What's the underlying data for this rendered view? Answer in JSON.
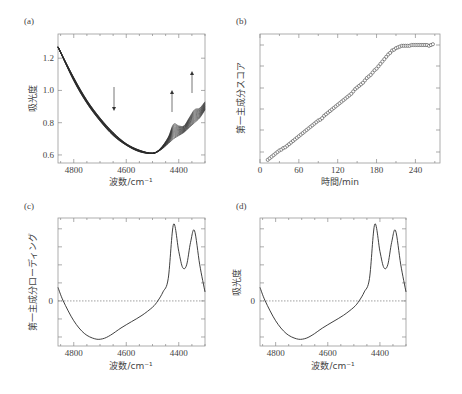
{
  "chart_data": [
    {
      "panel": "(a)",
      "type": "line",
      "title": "",
      "xlabel": "波数/cm⁻¹",
      "ylabel": "吸光度",
      "xlim": [
        4860,
        4300
      ],
      "ylim": [
        0.55,
        1.35
      ],
      "x_reversed": true,
      "xticks": [
        4800,
        4600,
        4400
      ],
      "yticks": [
        0.6,
        0.8,
        1.0,
        1.2
      ],
      "ytick_labels": [
        "0.6",
        "0.8",
        "1.0",
        "1.2"
      ],
      "grid": false,
      "series_description": "family of overlaid NIR spectra; minimum ~0.61 near 4500 cm⁻¹; bands near 4420 and 4340 cm⁻¹ grow with time",
      "series": [
        {
          "name": "first spectrum",
          "x": [
            4860,
            4800,
            4750,
            4700,
            4650,
            4600,
            4550,
            4500,
            4470,
            4440,
            4420,
            4400,
            4380,
            4360,
            4340,
            4320,
            4300
          ],
          "values": [
            1.27,
            1.08,
            0.94,
            0.83,
            0.74,
            0.67,
            0.63,
            0.61,
            0.63,
            0.67,
            0.7,
            0.72,
            0.74,
            0.77,
            0.8,
            0.83,
            0.88
          ]
        },
        {
          "name": "last spectrum",
          "x": [
            4860,
            4800,
            4750,
            4700,
            4650,
            4600,
            4550,
            4500,
            4470,
            4440,
            4420,
            4400,
            4380,
            4360,
            4340,
            4320,
            4300
          ],
          "values": [
            1.27,
            1.06,
            0.92,
            0.81,
            0.72,
            0.66,
            0.62,
            0.61,
            0.64,
            0.71,
            0.79,
            0.78,
            0.78,
            0.83,
            0.88,
            0.89,
            0.93
          ]
        }
      ],
      "annotations": [
        {
          "type": "arrow-down",
          "x": 4650,
          "y_from": 1.0,
          "y_to": 0.87
        },
        {
          "type": "arrow-up",
          "x": 4420,
          "y_from": 0.86,
          "y_to": 0.99
        },
        {
          "type": "arrow-up",
          "x": 4340,
          "y_from": 0.98,
          "y_to": 1.11
        }
      ]
    },
    {
      "panel": "(b)",
      "type": "scatter",
      "title": "",
      "xlabel": "時間/min",
      "ylabel": "第一主成分スコア",
      "xlim": [
        0,
        278
      ],
      "xticks": [
        0,
        60,
        120,
        180,
        240
      ],
      "yticks_unlabeled": 6,
      "grid": false,
      "marker": "open-circle",
      "x": [
        12,
        15,
        18,
        21,
        24,
        27,
        30,
        33,
        36,
        39,
        42,
        45,
        48,
        51,
        54,
        57,
        60,
        63,
        66,
        69,
        72,
        75,
        78,
        81,
        84,
        87,
        90,
        93,
        96,
        99,
        102,
        105,
        108,
        111,
        114,
        117,
        120,
        123,
        126,
        129,
        132,
        135,
        138,
        141,
        144,
        147,
        150,
        153,
        156,
        159,
        162,
        165,
        168,
        171,
        174,
        177,
        180,
        183,
        186,
        189,
        192,
        195,
        198,
        201,
        204,
        207,
        210,
        213,
        216,
        219,
        222,
        225,
        228,
        231,
        234,
        237,
        240,
        243,
        246,
        249,
        252,
        255,
        258,
        261,
        264,
        267
      ],
      "values": [
        0.02,
        0.03,
        0.04,
        0.05,
        0.06,
        0.07,
        0.08,
        0.085,
        0.095,
        0.1,
        0.11,
        0.12,
        0.13,
        0.14,
        0.15,
        0.16,
        0.17,
        0.18,
        0.19,
        0.2,
        0.21,
        0.22,
        0.23,
        0.24,
        0.25,
        0.26,
        0.27,
        0.275,
        0.285,
        0.3,
        0.31,
        0.32,
        0.33,
        0.34,
        0.35,
        0.36,
        0.37,
        0.38,
        0.39,
        0.4,
        0.41,
        0.42,
        0.43,
        0.44,
        0.455,
        0.47,
        0.48,
        0.49,
        0.5,
        0.51,
        0.525,
        0.54,
        0.55,
        0.56,
        0.575,
        0.59,
        0.6,
        0.615,
        0.63,
        0.645,
        0.66,
        0.675,
        0.69,
        0.7,
        0.715,
        0.72,
        0.73,
        0.735,
        0.74,
        0.745,
        0.745,
        0.745,
        0.745,
        0.745,
        0.75,
        0.75,
        0.75,
        0.75,
        0.75,
        0.75,
        0.75,
        0.75,
        0.75,
        0.745,
        0.75,
        0.755
      ],
      "ylim": [
        0,
        0.82
      ]
    },
    {
      "panel": "(c)",
      "type": "line",
      "title": "",
      "xlabel": "波数/cm⁻¹",
      "ylabel": "第一主成分ローディング",
      "xlim": [
        4860,
        4300
      ],
      "x_reversed": true,
      "xticks": [
        4800,
        4600,
        4400
      ],
      "yticks_labeled": [
        "0"
      ],
      "zero_line": "dotted",
      "grid": false,
      "x": [
        4860,
        4840,
        4800,
        4760,
        4720,
        4690,
        4660,
        4620,
        4580,
        4540,
        4500,
        4480,
        4460,
        4440,
        4420,
        4400,
        4385,
        4370,
        4355,
        4340,
        4320,
        4300
      ],
      "values": [
        0.15,
        0.0,
        -0.22,
        -0.36,
        -0.42,
        -0.42,
        -0.38,
        -0.3,
        -0.23,
        -0.16,
        -0.07,
        0.0,
        0.1,
        0.25,
        0.85,
        0.55,
        0.37,
        0.4,
        0.65,
        0.78,
        0.4,
        0.1
      ],
      "ylim": [
        -0.5,
        0.92
      ]
    },
    {
      "panel": "(d)",
      "type": "line",
      "title": "",
      "xlabel": "波数/cm⁻¹",
      "ylabel": "吸光度",
      "xlim": [
        4860,
        4300
      ],
      "x_reversed": true,
      "xticks": [
        4800,
        4600,
        4400
      ],
      "yticks_labeled": [
        "0"
      ],
      "zero_line": "dotted",
      "grid": false,
      "x": [
        4860,
        4840,
        4800,
        4760,
        4720,
        4690,
        4660,
        4620,
        4580,
        4540,
        4500,
        4480,
        4460,
        4440,
        4420,
        4400,
        4385,
        4370,
        4355,
        4340,
        4320,
        4300
      ],
      "values": [
        0.15,
        0.0,
        -0.22,
        -0.36,
        -0.42,
        -0.42,
        -0.38,
        -0.3,
        -0.23,
        -0.16,
        -0.07,
        0.0,
        0.1,
        0.25,
        0.85,
        0.55,
        0.37,
        0.4,
        0.65,
        0.78,
        0.4,
        0.1
      ],
      "ylim": [
        -0.5,
        0.92
      ]
    }
  ],
  "panels": {
    "a": {
      "label": "(a)",
      "xlabel": "波数/cm⁻¹",
      "ylabel": "吸光度",
      "xtick_labels": [
        "4800",
        "4600",
        "4400"
      ],
      "ytick_labels": [
        "0.6",
        "0.8",
        "1.0",
        "1.2"
      ]
    },
    "b": {
      "label": "(b)",
      "xlabel": "時間/min",
      "ylabel": "第一主成分スコア",
      "xtick_labels": [
        "0",
        "60",
        "120",
        "180",
        "240"
      ]
    },
    "c": {
      "label": "(c)",
      "xlabel": "波数/cm⁻¹",
      "ylabel": "第一主成分ローディング",
      "xtick_labels": [
        "4800",
        "4600",
        "4400"
      ],
      "zero_label": "0"
    },
    "d": {
      "label": "(d)",
      "xlabel": "波数/cm⁻¹",
      "ylabel": "吸光度",
      "xtick_labels": [
        "4800",
        "4600",
        "4400"
      ],
      "zero_label": "0"
    }
  },
  "colors": {
    "line": "#2a2a2a",
    "frame": "#999999",
    "tick_text": "#444444",
    "zero_line": "#777777"
  }
}
